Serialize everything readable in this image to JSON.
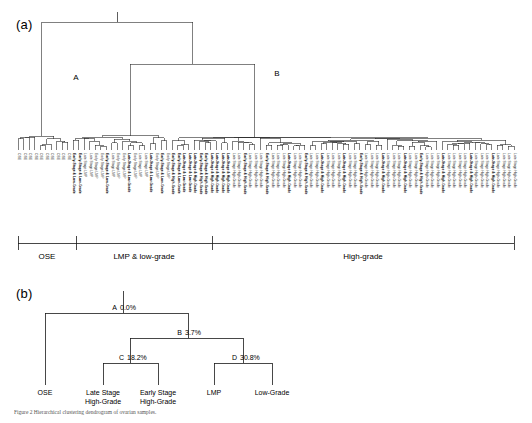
{
  "figure": {
    "panel_a_tag": "(a)",
    "panel_b_tag": "(b)",
    "caption": "Figure 2  Hierarchical clustering dendrogram of ovarian samples."
  },
  "panel_a": {
    "internal_node_labels": [
      {
        "label": "A",
        "x": 76,
        "y": 80
      },
      {
        "label": "B",
        "x": 277,
        "y": 76
      }
    ],
    "axis_groups": [
      {
        "label": "OSE",
        "start": 18,
        "end": 76
      },
      {
        "label": "LMP & low-grade",
        "start": 76,
        "end": 212
      },
      {
        "label": "High-grade",
        "start": 212,
        "end": 514
      }
    ],
    "leaf_labels": [
      "OSE",
      "OSE",
      "OSE",
      "OSE",
      "OSE",
      "OSE",
      "OSE",
      "OSE",
      "OSE",
      "OSE",
      "Early-Stage & Low-Grade",
      "Early-Stage & Low-Grade",
      "Late Stage LMP",
      "Late Stage LMP",
      "Early Stage LMP",
      "Early Stage LMP",
      "Early-Stage & Low-Grade",
      "Late Stage LMP",
      "Early Stage LMP",
      "Early Stage LMP",
      "Late-Stage & Low-Grade",
      "Early Stage LMP",
      "Late Stage LMP",
      "Late Stage LMP",
      "Late-Stage & Low-Grade",
      "Early Stage LMP",
      "Early-Stage & Low-Grade",
      "Early Stage LMP",
      "Early-Stage & High-Grade",
      "Early-Stage & Low-Grade",
      "Late-Stage & Low-Grade",
      "Late-Stage & Low-Grade",
      "Late-Stage & High-Grade",
      "Early-Stage & High-Grade",
      "Early-Stage & High-Grade",
      "Late-Stage & High-Grade",
      "Late-Stage & High-Grade",
      "Late-Stage & High-Grade",
      "Late-Stage & High-Grade",
      "Late Stage High-Grade",
      "Late Stage High-Grade",
      "Early-Stage & High-Grade",
      "Late Stage High-Grade",
      "Late Stage High-Grade",
      "Late Stage High-Grade",
      "Early-Stage & High-Grade",
      "Late Stage High-Grade",
      "Late Stage High-Grade",
      "Late Stage High-Grade",
      "Late-Stage & High-Grade",
      "Late Stage High-Grade",
      "Late Stage High-Grade",
      "Early-Stage & High-Grade",
      "Late Stage High-Grade",
      "Late Stage High-Grade",
      "Late-Stage & High-Grade",
      "Late Stage High-Grade",
      "Late Stage High-Grade",
      "Late Stage High-Grade",
      "Late-Stage & High-Grade",
      "Late Stage High-Grade",
      "Late Stage High-Grade",
      "Early-Stage & High-Grade",
      "Late Stage High-Grade",
      "Late Stage High-Grade",
      "Late Stage High-Grade",
      "Late-Stage & High-Grade",
      "Late Stage High-Grade",
      "Late Stage High-Grade",
      "Late Stage High-Grade",
      "Late-Stage & High-Grade",
      "Late Stage High-Grade",
      "Late Stage High-Grade",
      "Early-Stage & High-Grade",
      "Late Stage High-Grade",
      "Late Stage High-Grade",
      "Late Stage High-Grade",
      "Late-Stage & High-Grade",
      "Late Stage High-Grade",
      "Late Stage High-Grade",
      "Late Stage High-Grade",
      "Late Stage High-Grade",
      "Late-Stage & High-Grade",
      "Late Stage High-Grade",
      "Late Stage High-Grade",
      "Late Stage High-Grade",
      "Late-Stage & High-Grade",
      "Late Stage High-Grade",
      "Late Stage High-Grade",
      "Late Stage High-Grade",
      "Late Stage High-Grade"
    ],
    "bold_leaf_indices": [
      10,
      11,
      16,
      20,
      24,
      26,
      28,
      29,
      30,
      31,
      32,
      33,
      34,
      35,
      36,
      37,
      38,
      41,
      45,
      49,
      52,
      55,
      59,
      62,
      66,
      70,
      73,
      77,
      82,
      86
    ]
  },
  "chart_data": {
    "type": "tree",
    "panel_a": {
      "type": "dendrogram",
      "orientation": "vertical",
      "n_leaves": 90,
      "labeled_nodes": [
        "A",
        "B"
      ],
      "group_brackets": [
        "OSE",
        "LMP & low-grade",
        "High-grade"
      ]
    },
    "panel_b": {
      "type": "tree",
      "nodes": [
        {
          "id": "A",
          "label": "A",
          "value": "0.0%",
          "percent": 0.0
        },
        {
          "id": "B",
          "label": "B",
          "value": "3.7%",
          "percent": 3.7
        },
        {
          "id": "C",
          "label": "C",
          "value": "18.2%",
          "percent": 18.2
        },
        {
          "id": "D",
          "label": "D",
          "value": "30.8%",
          "percent": 30.8
        }
      ],
      "leaves": [
        {
          "label": "OSE",
          "lines": [
            "OSE"
          ]
        },
        {
          "label": "Late Stage High-Grade",
          "lines": [
            "Late Stage",
            "High-Grade"
          ]
        },
        {
          "label": "Early Stage High-Grade",
          "lines": [
            "Early Stage",
            "High-Grade"
          ]
        },
        {
          "label": "LMP",
          "lines": [
            "LMP"
          ]
        },
        {
          "label": "Low-Grade",
          "lines": [
            "Low-Grade"
          ]
        }
      ]
    }
  },
  "panel_b": {
    "nodes": {
      "a_letter": "A",
      "a_value": "0.0%",
      "b_letter": "B",
      "b_value": "3.7%",
      "c_letter": "C",
      "c_value": "18.2%",
      "d_letter": "D",
      "d_value": "30.8%"
    },
    "leaves": {
      "ose": "OSE",
      "late_high_l1": "Late Stage",
      "late_high_l2": "High-Grade",
      "early_high_l1": "Early Stage",
      "early_high_l2": "High-Grade",
      "lmp": "LMP",
      "low_grade": "Low-Grade"
    }
  }
}
